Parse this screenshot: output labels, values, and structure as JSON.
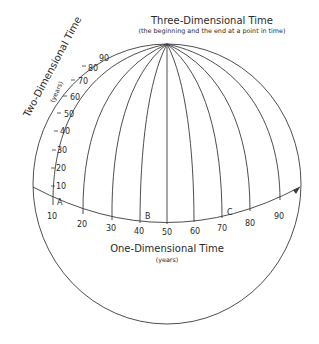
{
  "diagram": {
    "top_label": {
      "title": "Three-Dimensional Time",
      "subtitle": "(the beginning and the end at a point in time)"
    },
    "left_label": {
      "title": "Two-Dimensional Time",
      "subtitle": "(years)"
    },
    "bottom_label": {
      "title": "One-Dimensional Time",
      "subtitle": "(years)"
    },
    "horizontal_ticks": [
      "10",
      "20",
      "30",
      "40",
      "50",
      "60",
      "70",
      "80",
      "90"
    ],
    "vertical_ticks": [
      "10",
      "20",
      "30",
      "40",
      "50",
      "60",
      "70",
      "80",
      "90"
    ],
    "points": {
      "a": "A",
      "b": "B",
      "c": "C"
    },
    "colors": {
      "line": "#3a3a3a",
      "text": "#2a2a2a",
      "background": "#ffffff"
    }
  }
}
